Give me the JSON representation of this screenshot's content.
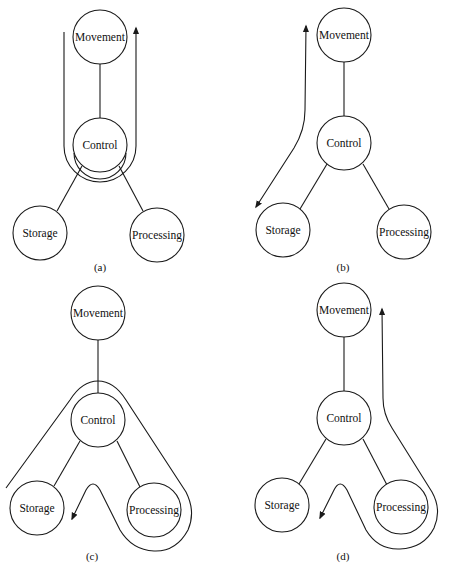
{
  "figure": {
    "node_labels": {
      "movement": "Movement",
      "control": "Control",
      "storage": "Storage",
      "processing": "Processing"
    },
    "panels": [
      {
        "id": "a",
        "label": "(a)",
        "flow": "Movement -> Control -> Movement (U-turn around Control)",
        "nodes": {
          "movement": {
            "label": "Movement",
            "cx": 100,
            "cy": 37
          },
          "control": {
            "label": "Control",
            "cx": 100,
            "cy": 145
          },
          "storage": {
            "label": "Storage",
            "cx": 40,
            "cy": 233
          },
          "processing": {
            "label": "Processing",
            "cx": 157,
            "cy": 235
          }
        }
      },
      {
        "id": "b",
        "label": "(b)",
        "flow": "Movement <-> Storage (bidirectional)",
        "nodes": {
          "movement": {
            "label": "Movement",
            "cx": 344,
            "cy": 35
          },
          "control": {
            "label": "Control",
            "cx": 344,
            "cy": 143
          },
          "storage": {
            "label": "Storage",
            "cx": 283,
            "cy": 230
          },
          "processing": {
            "label": "Processing",
            "cx": 404,
            "cy": 232
          }
        }
      },
      {
        "id": "c",
        "label": "(c)",
        "flow": "Storage -> over Control -> around Processing -> Storage",
        "nodes": {
          "movement": {
            "label": "Movement",
            "cx": 98,
            "cy": 313
          },
          "control": {
            "label": "Control",
            "cx": 98,
            "cy": 420
          },
          "storage": {
            "label": "Storage",
            "cx": 37,
            "cy": 508
          },
          "processing": {
            "label": "Processing",
            "cx": 154,
            "cy": 510
          }
        }
      },
      {
        "id": "d",
        "label": "(d)",
        "flow": "Movement <- around Processing <- Storage (bidirectional)",
        "nodes": {
          "movement": {
            "label": "Movement",
            "cx": 344,
            "cy": 310
          },
          "control": {
            "label": "Control",
            "cx": 344,
            "cy": 418
          },
          "storage": {
            "label": "Storage",
            "cx": 282,
            "cy": 505
          },
          "processing": {
            "label": "Processing",
            "cx": 401,
            "cy": 507
          }
        }
      }
    ]
  }
}
